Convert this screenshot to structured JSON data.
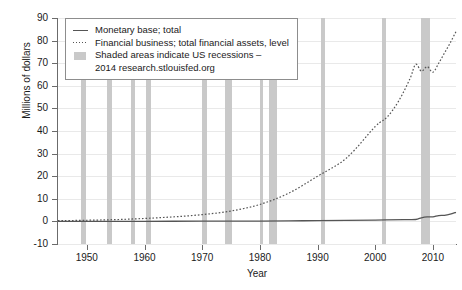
{
  "chart_data": {
    "type": "line",
    "title": "",
    "xlabel": "Year",
    "ylabel": "Millions of dollars",
    "xlim": [
      1945,
      2014
    ],
    "ylim": [
      -10,
      90
    ],
    "xticks": [
      1950,
      1960,
      1970,
      1980,
      1990,
      2000,
      2010
    ],
    "yticks": [
      -10,
      0,
      10,
      20,
      30,
      40,
      50,
      60,
      70,
      80,
      90
    ],
    "grid": "horizontal",
    "legend_position": "top-left",
    "series": [
      {
        "name": "Monetary base; total",
        "style": "solid",
        "color": "#555555",
        "x": [
          1945,
          1950,
          1955,
          1960,
          1965,
          1970,
          1975,
          1980,
          1985,
          1990,
          1995,
          2000,
          2005,
          2007,
          2008,
          2009,
          2010,
          2011,
          2012,
          2013,
          2014
        ],
        "values": [
          0.04,
          0.05,
          0.05,
          0.05,
          0.06,
          0.08,
          0.11,
          0.16,
          0.24,
          0.32,
          0.43,
          0.58,
          0.79,
          0.85,
          1.6,
          2.0,
          2.0,
          2.6,
          2.7,
          3.2,
          4.0
        ]
      },
      {
        "name": "Financial business; total financial assets, level",
        "style": "dotted",
        "color": "#555555",
        "x": [
          1945,
          1950,
          1955,
          1960,
          1965,
          1970,
          1975,
          1980,
          1985,
          1990,
          1995,
          2000,
          2002,
          2004,
          2006,
          2007,
          2008,
          2009,
          2010,
          2011,
          2012,
          2013,
          2014
        ],
        "values": [
          0.3,
          0.5,
          0.8,
          1.3,
          2.0,
          3.0,
          4.6,
          7.5,
          12.5,
          20.0,
          28.0,
          42.0,
          46.0,
          53.0,
          63.0,
          69.5,
          66.5,
          68.5,
          66.0,
          70.0,
          74.5,
          79.0,
          84.0
        ]
      }
    ],
    "shaded_regions": {
      "label": "US recessions",
      "color": "#c9c9c9",
      "spans": [
        [
          1948.9,
          1949.8
        ],
        [
          1953.5,
          1954.4
        ],
        [
          1957.6,
          1958.4
        ],
        [
          1960.3,
          1961.1
        ],
        [
          1969.9,
          1970.9
        ],
        [
          1973.9,
          1975.2
        ],
        [
          1980.0,
          1980.6
        ],
        [
          1981.5,
          1982.9
        ],
        [
          1990.6,
          1991.2
        ],
        [
          2001.2,
          2001.9
        ],
        [
          2007.9,
          2009.5
        ]
      ]
    },
    "legend": {
      "items": [
        {
          "key": "solid-line",
          "label": "Monetary base; total"
        },
        {
          "key": "dotted-line",
          "label": "Financial business; total financial assets, level"
        },
        {
          "key": "grey-swatch",
          "label": "Shaded areas indicate US recessions –"
        }
      ],
      "continuation": "2014 research.stlouisfed.org"
    }
  }
}
